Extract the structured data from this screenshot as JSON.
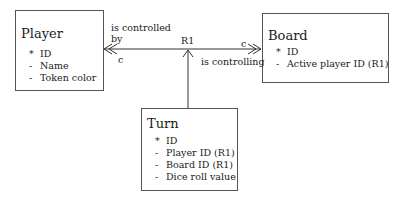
{
  "entities": {
    "player": {
      "title": "Player",
      "attributes": [
        {
          "mark": "*",
          "name": "ID"
        },
        {
          "mark": "-",
          "name": "Name"
        },
        {
          "mark": "-",
          "name": "Token color"
        }
      ]
    },
    "board": {
      "title": "Board",
      "attributes": [
        {
          "mark": "*",
          "name": "ID"
        },
        {
          "mark": "-",
          "name": "Active player ID (R1)"
        }
      ]
    },
    "turn": {
      "title": "Turn",
      "attributes": [
        {
          "mark": "*",
          "name": "ID"
        },
        {
          "mark": "-",
          "name": "Player ID (R1)"
        },
        {
          "mark": "-",
          "name": "Board ID (R1)"
        },
        {
          "mark": "-",
          "name": "Dice roll value"
        }
      ]
    }
  },
  "relationship": {
    "name": "R1",
    "player_side_phrase_line1": "is controlled",
    "player_side_phrase_line2": "by",
    "player_side_multiplicity": "c",
    "board_side_phrase": "is controlling",
    "board_side_multiplicity": "c"
  }
}
